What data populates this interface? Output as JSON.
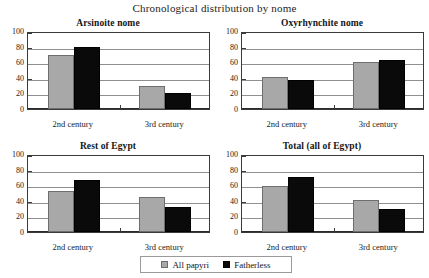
{
  "chart_data": {
    "type": "bar",
    "title": "Chronological distribution by nome",
    "categories": [
      "2nd century",
      "3rd century"
    ],
    "ylim": [
      0,
      100
    ],
    "yticks": [
      0,
      20,
      40,
      60,
      80,
      100
    ],
    "ytick_labels": [
      "0",
      "20",
      "40",
      "60",
      "80",
      "100"
    ],
    "xlabel": "",
    "ylabel": "",
    "grid": true,
    "legend_position": "bottom-center",
    "legend": [
      "All papyri",
      "Fatherless"
    ],
    "series_colors": {
      "All papyri": "#a8a8a8",
      "Fatherless": "#0a0a0a"
    },
    "panels": [
      {
        "title": "Arsinoite nome",
        "categories": [
          "2nd century",
          "3rd century"
        ],
        "series": [
          {
            "name": "All papyri",
            "values": [
              69,
              29
            ]
          },
          {
            "name": "Fatherless",
            "values": [
              79,
              20
            ]
          }
        ]
      },
      {
        "title": "Oxyrhynchite nome",
        "categories": [
          "2nd century",
          "3rd century"
        ],
        "series": [
          {
            "name": "All papyri",
            "values": [
              41,
              60
            ]
          },
          {
            "name": "Fatherless",
            "values": [
              37,
              63
            ]
          }
        ]
      },
      {
        "title": "Rest of Egypt",
        "categories": [
          "2nd century",
          "3rd century"
        ],
        "series": [
          {
            "name": "All papyri",
            "values": [
              53,
              45
            ]
          },
          {
            "name": "Fatherless",
            "values": [
              67,
              32
            ]
          }
        ]
      },
      {
        "title": "Total (all of Egypt)",
        "categories": [
          "2nd century",
          "3rd century"
        ],
        "series": [
          {
            "name": "All papyri",
            "values": [
              59,
              41
            ]
          },
          {
            "name": "Fatherless",
            "values": [
              71,
              29
            ]
          }
        ]
      }
    ]
  }
}
